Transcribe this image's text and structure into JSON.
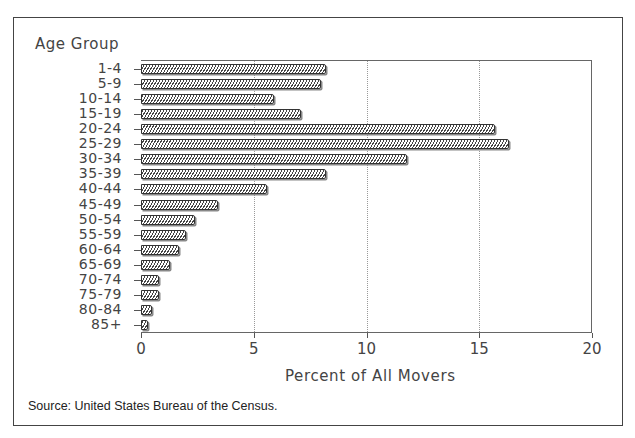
{
  "chart_data": {
    "type": "bar",
    "orientation": "horizontal",
    "title": "",
    "ylabel": "Age Group",
    "xlabel": "Percent of All Movers",
    "xlim": [
      0,
      20
    ],
    "xticks": [
      "0",
      "5",
      "10",
      "15",
      "20"
    ],
    "grid": {
      "vertical": true,
      "at": [
        5,
        10,
        15
      ]
    },
    "legend": null,
    "categories": [
      "1-4",
      "5-9",
      "10-14",
      "15-19",
      "20-24",
      "25-29",
      "30-34",
      "35-39",
      "40-44",
      "45-49",
      "50-54",
      "55-59",
      "60-64",
      "65-69",
      "70-74",
      "75-79",
      "80-84",
      "85+"
    ],
    "values": [
      8.2,
      8.0,
      5.9,
      7.1,
      15.7,
      16.3,
      11.8,
      8.2,
      5.6,
      3.4,
      2.4,
      2.0,
      1.7,
      1.3,
      0.8,
      0.8,
      0.5,
      0.3
    ],
    "source": "Source: United States Bureau of the Census."
  }
}
